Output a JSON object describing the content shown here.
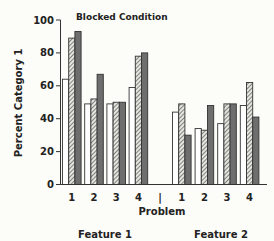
{
  "chart_data": {
    "type": "bar",
    "title": "Blocked Condition",
    "xlabel": "Problem",
    "ylabel": "Percent Category 1",
    "ylim": [
      0,
      100
    ],
    "yticks": [
      0,
      20,
      40,
      60,
      80,
      100
    ],
    "grid": false,
    "legend": null,
    "panels": [
      {
        "name": "Feature 1",
        "categories": [
          "1",
          "2",
          "3",
          "4"
        ],
        "series": [
          {
            "name": "open",
            "pattern": "white",
            "values": [
              64,
              49,
              49,
              59
            ]
          },
          {
            "name": "hatched",
            "pattern": "hatched",
            "values": [
              89,
              52,
              50,
              78
            ]
          },
          {
            "name": "dark",
            "pattern": "dark-gray",
            "values": [
              93,
              67,
              50,
              80
            ]
          }
        ]
      },
      {
        "name": "Feature 2",
        "categories": [
          "1",
          "2",
          "3",
          "4"
        ],
        "series": [
          {
            "name": "open",
            "pattern": "white",
            "values": [
              44,
              34,
              37,
              48
            ]
          },
          {
            "name": "hatched",
            "pattern": "hatched",
            "values": [
              49,
              33,
              49,
              62
            ]
          },
          {
            "name": "dark",
            "pattern": "dark-gray",
            "values": [
              30,
              48,
              49,
              41
            ]
          }
        ]
      }
    ],
    "separator_label": "|",
    "colors": {
      "open": "#ffffff",
      "hatched": "#9a9a9a",
      "dark": "#6e6e6e",
      "stroke": "#333333"
    }
  }
}
